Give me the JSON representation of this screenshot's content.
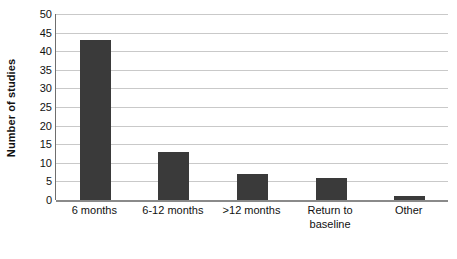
{
  "chart_data": {
    "type": "bar",
    "title": "",
    "subtitle": "",
    "xlabel": "",
    "ylabel": "Number of studies",
    "categories": [
      "6 months",
      "6-12 months",
      ">12 months",
      "Return to\nbaseline",
      "Other"
    ],
    "values": [
      43,
      13,
      7,
      6,
      1
    ],
    "ylim": [
      0,
      50
    ],
    "ytick_values": [
      0,
      5,
      10,
      15,
      20,
      25,
      30,
      35,
      40,
      45,
      50
    ],
    "ytick_labels": [
      "0",
      "5",
      "10",
      "15",
      "20",
      "25",
      "30",
      "35",
      "40",
      "45",
      "50"
    ],
    "grid": true,
    "grid_axis": "y",
    "legend": false,
    "legend_position": "none",
    "bar_color": "#3a3a3a",
    "gridline_color": "#c9c9c9",
    "axis_color": "#6e6e6e",
    "background_color": "#ffffff"
  }
}
